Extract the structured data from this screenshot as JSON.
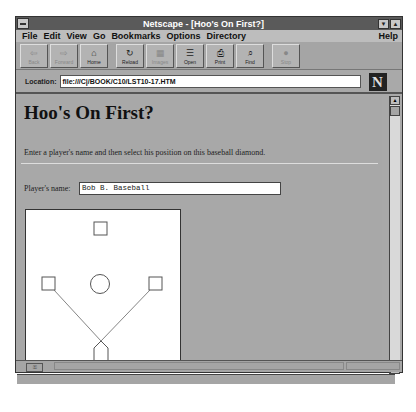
{
  "window": {
    "title": "Netscape - [Hoo's On First?]",
    "minimize_glyph": "▼",
    "maximize_glyph": "▲"
  },
  "menu": {
    "items": [
      "File",
      "Edit",
      "View",
      "Go",
      "Bookmarks",
      "Options",
      "Directory"
    ],
    "help": "Help"
  },
  "toolbar": {
    "buttons": [
      {
        "label": "Back",
        "icon": "back-icon",
        "glyph": "⇦",
        "enabled": false
      },
      {
        "label": "Forward",
        "icon": "forward-icon",
        "glyph": "⇨",
        "enabled": false
      },
      {
        "label": "Home",
        "icon": "home-icon",
        "glyph": "⌂",
        "enabled": true
      },
      {
        "label": "Reload",
        "icon": "reload-icon",
        "glyph": "↻",
        "enabled": true
      },
      {
        "label": "Images",
        "icon": "images-icon",
        "glyph": "▦",
        "enabled": false
      },
      {
        "label": "Open",
        "icon": "open-icon",
        "glyph": "☰",
        "enabled": true
      },
      {
        "label": "Print",
        "icon": "print-icon",
        "glyph": "⎙",
        "enabled": true
      },
      {
        "label": "Find",
        "icon": "find-icon",
        "glyph": "⌕",
        "enabled": true
      },
      {
        "label": "Stop",
        "icon": "stop-icon",
        "glyph": "●",
        "enabled": false
      }
    ]
  },
  "location": {
    "label": "Location:",
    "url": "file:///C|/BOOK/C10/LST10-17.HTM",
    "logo": "N"
  },
  "page": {
    "heading": "Hoo's On First?",
    "intro": "Enter a player's name and then select his position on this baseball diamond.",
    "player_label": "Player's name:",
    "player_value": "Bob B. Baseball"
  },
  "statusbar": {
    "security_icon": "key-icon",
    "text": ""
  }
}
